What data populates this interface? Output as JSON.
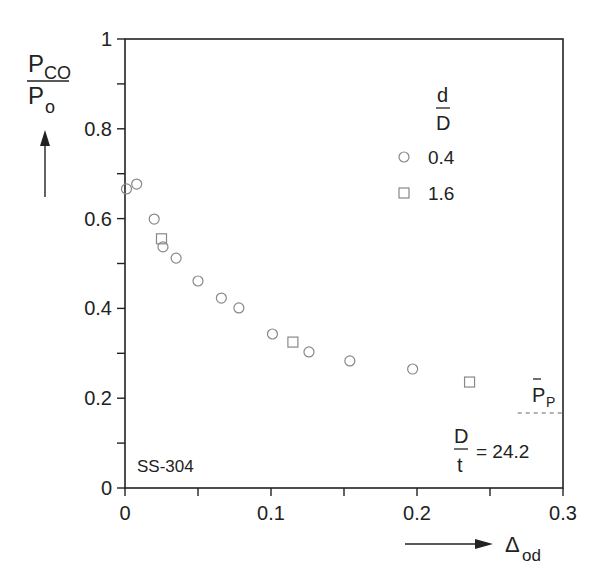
{
  "chart_data": {
    "type": "scatter",
    "title": "",
    "xlabel": "Δod",
    "ylabel": "PCO / Po",
    "xlim": [
      0,
      0.3
    ],
    "ylim": [
      0,
      1
    ],
    "grid": false,
    "x_ticks": [
      "0",
      "0.1",
      "0.2",
      "0.3"
    ],
    "y_ticks": [
      "0",
      "0.2",
      "0.4",
      "0.6",
      "0.8",
      "1"
    ],
    "legend": {
      "title_num": "d",
      "title_den": "D",
      "position": "upper right",
      "entries": [
        {
          "marker": "circle",
          "label": "0.4"
        },
        {
          "marker": "square",
          "label": "1.6"
        }
      ]
    },
    "series": [
      {
        "name": "0.4",
        "marker": "circle",
        "x": [
          0.001,
          0.008,
          0.02,
          0.026,
          0.035,
          0.05,
          0.066,
          0.078,
          0.101,
          0.126,
          0.154,
          0.197
        ],
        "y": [
          0.666,
          0.677,
          0.599,
          0.537,
          0.512,
          0.461,
          0.423,
          0.401,
          0.343,
          0.303,
          0.283,
          0.265
        ]
      },
      {
        "name": "1.6",
        "marker": "square",
        "x": [
          0.025,
          0.115,
          0.236
        ],
        "y": [
          0.555,
          0.325,
          0.236
        ]
      }
    ],
    "reference_line": {
      "label_base": "P",
      "label_sub": "P",
      "label_overbar": true,
      "y": 0.167,
      "x_start": 0.269,
      "x_end": 0.3,
      "style": "dashed"
    },
    "annotations": {
      "material": "SS-304",
      "ratio_num": "D",
      "ratio_den": "t",
      "ratio_value": "= 24.2"
    },
    "ylabel_parts": {
      "num_base": "P",
      "num_sub": "CO",
      "den_base": "P",
      "den_sub": "o"
    },
    "xlabel_parts": {
      "base": "Δ",
      "sub": "od"
    }
  }
}
